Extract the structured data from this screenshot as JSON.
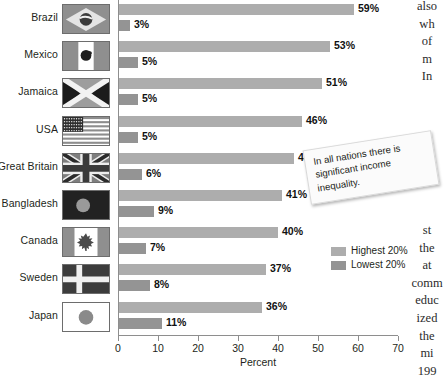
{
  "chart_data": {
    "type": "bar",
    "orientation": "horizontal",
    "title": "",
    "xlabel": "Percent",
    "ylabel": "",
    "xlim": [
      0,
      70
    ],
    "xticks": [
      0,
      10,
      20,
      30,
      40,
      50,
      60,
      70
    ],
    "grid": false,
    "legend_position": "right",
    "categories": [
      "Brazil",
      "Mexico",
      "Jamaica",
      "USA",
      "Great Britain",
      "Bangladesh",
      "Canada",
      "Sweden",
      "Japan"
    ],
    "series": [
      {
        "name": "Highest 20%",
        "color": "#adadad",
        "values": [
          59,
          53,
          51,
          46,
          44,
          41,
          40,
          37,
          36
        ],
        "labels": [
          "59%",
          "53%",
          "51%",
          "46%",
          "44%",
          "41%",
          "40%",
          "37%",
          "36%"
        ]
      },
      {
        "name": "Lowest 20%",
        "color": "#949494",
        "values": [
          3,
          5,
          5,
          5,
          6,
          9,
          7,
          8,
          11
        ],
        "labels": [
          "3%",
          "5%",
          "5%",
          "5%",
          "6%",
          "9%",
          "7%",
          "8%",
          "11%"
        ]
      }
    ]
  },
  "axis": {
    "x_title": "Percent",
    "tick_labels": [
      "0",
      "10",
      "20",
      "30",
      "40",
      "50",
      "60",
      "70"
    ]
  },
  "legend": {
    "items": [
      {
        "label": "Highest 20%",
        "color": "#adadad"
      },
      {
        "label": "Lowest 20%",
        "color": "#949494"
      }
    ]
  },
  "callout": {
    "text": "In all nations there is significant income inequality."
  },
  "rows": [
    {
      "country": "Brazil",
      "flag": "flag-brazil",
      "high": "59%",
      "low": "3%"
    },
    {
      "country": "Mexico",
      "flag": "flag-mexico",
      "high": "53%",
      "low": "5%"
    },
    {
      "country": "Jamaica",
      "flag": "flag-jamaica",
      "high": "51%",
      "low": "5%"
    },
    {
      "country": "USA",
      "flag": "flag-usa",
      "high": "46%",
      "low": "5%"
    },
    {
      "country": "Great Britain",
      "flag": "flag-great-britain",
      "high": "44%",
      "low": "6%"
    },
    {
      "country": "Bangladesh",
      "flag": "flag-bangladesh",
      "high": "41%",
      "low": "9%"
    },
    {
      "country": "Canada",
      "flag": "flag-canada",
      "high": "40%",
      "low": "7%"
    },
    {
      "country": "Sweden",
      "flag": "flag-sweden",
      "high": "37%",
      "low": "8%"
    },
    {
      "country": "Japan",
      "flag": "flag-japan",
      "high": "36%",
      "low": "11%"
    }
  ],
  "page_text": {
    "upper_lines": [
      "also",
      "wh",
      "of",
      "m",
      "In"
    ],
    "lower_lines": [
      "st",
      "the",
      "at",
      "comm",
      "educ",
      "ized",
      "the",
      "mi",
      "199"
    ]
  }
}
